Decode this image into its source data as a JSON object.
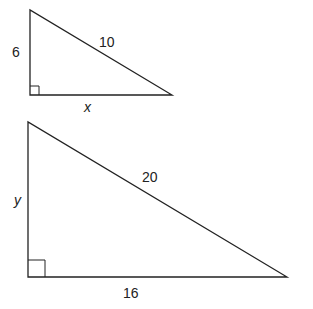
{
  "diagram": {
    "small_triangle": {
      "leg_vertical_label": "6",
      "hypotenuse_label": "10",
      "leg_horizontal_label": "x"
    },
    "large_triangle": {
      "leg_vertical_label": "y",
      "hypotenuse_label": "20",
      "leg_horizontal_label": "16"
    },
    "colors": {
      "stroke": "#222222",
      "background": "#ffffff"
    }
  }
}
